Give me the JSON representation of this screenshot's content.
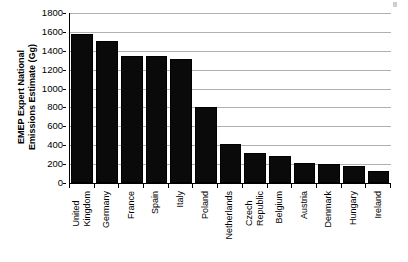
{
  "chart_data": {
    "type": "bar",
    "title": "",
    "xlabel": "",
    "ylabel": "EMEP Expert National Emissions Estimate (Gg)",
    "ylabel_line1": "EMEP Expert National",
    "ylabel_line2": "Emissions Estimate (Gg)",
    "ylim": [
      0,
      1800
    ],
    "ytick_step": 200,
    "yticks": [
      1800,
      1600,
      1400,
      1200,
      1000,
      800,
      600,
      400,
      200,
      0
    ],
    "grid": true,
    "grid_axis": "y",
    "legend": false,
    "bar_color": "#0a0a0a",
    "grid_color": "#b0b0b0",
    "axis_color": "#000000",
    "categories": [
      "United Kingdom",
      "Germany",
      "France",
      "Spain",
      "Italy",
      "Poland",
      "Netherlands",
      "Czech Republic",
      "Belgium",
      "Austria",
      "Denmark",
      "Hungary",
      "Ireland"
    ],
    "category_lines": [
      [
        "United",
        "Kingdom"
      ],
      [
        "Germany",
        ""
      ],
      [
        "France",
        ""
      ],
      [
        "Spain",
        ""
      ],
      [
        "Italy",
        ""
      ],
      [
        "Poland",
        ""
      ],
      [
        "Netherlands",
        ""
      ],
      [
        "Czech",
        "Republic"
      ],
      [
        "Belgium",
        ""
      ],
      [
        "Austria",
        ""
      ],
      [
        "Denmark",
        ""
      ],
      [
        "Hungary",
        ""
      ],
      [
        "Ireland",
        ""
      ]
    ],
    "values": [
      1580,
      1500,
      1345,
      1345,
      1315,
      800,
      410,
      315,
      290,
      210,
      200,
      180,
      125
    ]
  }
}
